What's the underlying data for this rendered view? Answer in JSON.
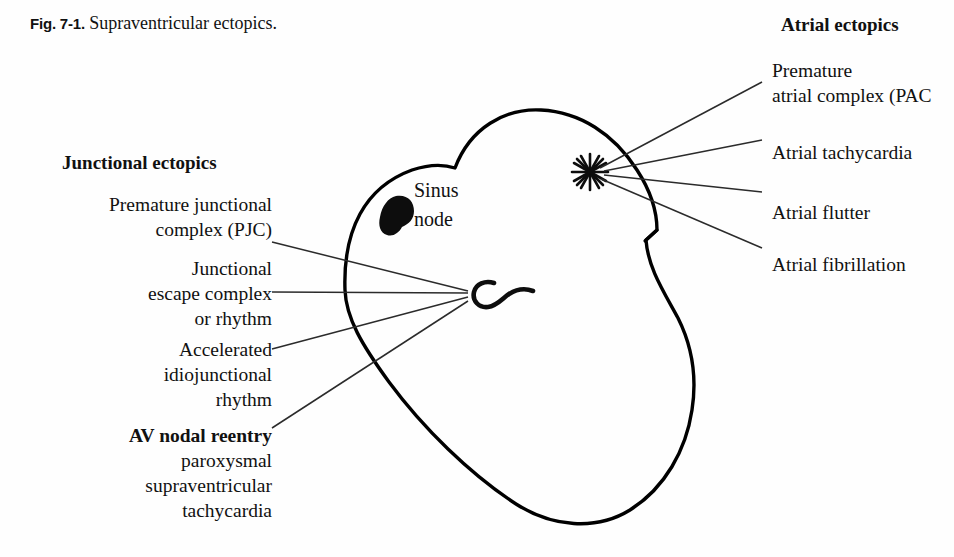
{
  "figure": {
    "label": "Fig. 7-1.",
    "title": "Supraventricular ectopics."
  },
  "colors": {
    "ink": "#111111",
    "outline": "#000000",
    "leader": "#333333",
    "background": "#fefefe"
  },
  "diagram": {
    "name": "heart-schematic",
    "sinus_node": {
      "label_line1": "Sinus",
      "label_line2": "node",
      "marker": "filled-blob-icon"
    },
    "atrial_focus_marker": "asterisk-icon",
    "av_node_marker": "av-node-hook-icon"
  },
  "junctional": {
    "heading": "Junctional ectopics",
    "items": [
      {
        "name": "premature-junctional-complex",
        "lines": [
          "Premature junctional",
          "complex (PJC)"
        ],
        "bold_lines": []
      },
      {
        "name": "junctional-escape-complex",
        "lines": [
          "Junctional",
          "escape complex",
          "or rhythm"
        ],
        "bold_lines": []
      },
      {
        "name": "accelerated-idiojunctional-rhythm",
        "lines": [
          "Accelerated",
          "idiojunctional",
          "rhythm"
        ],
        "bold_lines": []
      },
      {
        "name": "av-nodal-reentry",
        "lines": [
          "AV nodal reentry",
          "paroxysmal",
          "supraventricular",
          "tachycardia"
        ],
        "bold_lines": [
          "AV nodal reentry"
        ]
      }
    ]
  },
  "atrial": {
    "heading": "Atrial ectopics",
    "items": [
      {
        "name": "premature-atrial-complex",
        "lines": [
          "Premature",
          "atrial complex (PAC"
        ],
        "clipped": true
      },
      {
        "name": "atrial-tachycardia",
        "lines": [
          "Atrial tachycardia"
        ],
        "clipped": true
      },
      {
        "name": "atrial-flutter",
        "lines": [
          "Atrial flutter"
        ],
        "clipped": false
      },
      {
        "name": "atrial-fibrillation",
        "lines": [
          "Atrial fibrillation"
        ],
        "clipped": false
      }
    ]
  }
}
